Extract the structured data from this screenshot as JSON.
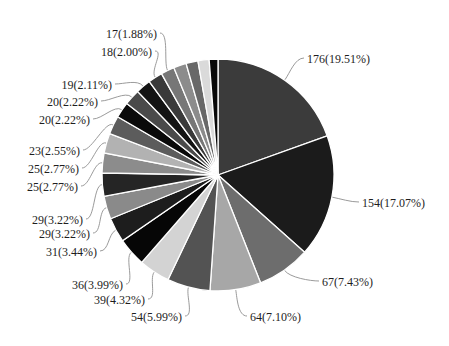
{
  "chart_data": {
    "type": "pie",
    "title": "",
    "start_angle": "12 o'clock",
    "direction": "clockwise",
    "total": 902,
    "layout": {
      "width": 449,
      "height": 346,
      "center": [
        218,
        175
      ],
      "radius": 116,
      "legend": "none",
      "labels": "outside with leader lines"
    },
    "slices": [
      {
        "value": 176,
        "percent": 19.51,
        "label": "176(19.51%)",
        "color": "#3b3b3b",
        "side": "right",
        "lx": 307,
        "ly": 59
      },
      {
        "value": 154,
        "percent": 17.07,
        "label": "154(17.07%)",
        "color": "#1b1b1b",
        "side": "right",
        "lx": 362,
        "ly": 203
      },
      {
        "value": 67,
        "percent": 7.43,
        "label": "67(7.43%)",
        "color": "#6d6d6d",
        "side": "right",
        "lx": 322,
        "ly": 282
      },
      {
        "value": 64,
        "percent": 7.1,
        "label": "64(7.10%)",
        "color": "#a7a7a7",
        "side": "right",
        "lx": 250,
        "ly": 317
      },
      {
        "value": 54,
        "percent": 5.99,
        "label": "54(5.99%)",
        "color": "#535353",
        "side": "left",
        "lx": 182,
        "ly": 317
      },
      {
        "value": 39,
        "percent": 4.32,
        "label": "39(4.32%)",
        "color": "#d3d3d3",
        "side": "left",
        "lx": 145,
        "ly": 300
      },
      {
        "value": 36,
        "percent": 3.99,
        "label": "36(3.99%)",
        "color": "#060606",
        "side": "left",
        "lx": 123,
        "ly": 285
      },
      {
        "value": 31,
        "percent": 3.44,
        "label": "31(3.44%)",
        "color": "#1d1d1d",
        "side": "left",
        "lx": 97,
        "ly": 252
      },
      {
        "value": 29,
        "percent": 3.22,
        "label": "29(3.22%)",
        "color": "#8a8a8a",
        "side": "left",
        "lx": 90,
        "ly": 234
      },
      {
        "value": 29,
        "percent": 3.22,
        "label": "29(3.22%)",
        "color": "#252525",
        "side": "left",
        "lx": 83,
        "ly": 220
      },
      {
        "value": 25,
        "percent": 2.77,
        "label": "25(2.77%)",
        "color": "#8c8c8c",
        "side": "left",
        "lx": 78,
        "ly": 187
      },
      {
        "value": 25,
        "percent": 2.77,
        "label": "25(2.77%)",
        "color": "#b2b2b2",
        "side": "left",
        "lx": 79,
        "ly": 169
      },
      {
        "value": 23,
        "percent": 2.55,
        "label": "23(2.55%)",
        "color": "#5c5c5c",
        "side": "left",
        "lx": 80,
        "ly": 151
      },
      {
        "value": 20,
        "percent": 2.22,
        "label": "20(2.22%)",
        "color": "#0a0a0a",
        "side": "left",
        "lx": 90,
        "ly": 120
      },
      {
        "value": 20,
        "percent": 2.22,
        "label": "20(2.22%)",
        "color": "#4a4a4a",
        "side": "left",
        "lx": 98,
        "ly": 102
      },
      {
        "value": 19,
        "percent": 2.11,
        "label": "19(2.11%)",
        "color": "#141414",
        "side": "left",
        "lx": 112,
        "ly": 85
      },
      {
        "value": 18,
        "percent": 2.0,
        "label": "18(2.00%)",
        "color": "#3a3a3a",
        "side": "left",
        "lx": 152,
        "ly": 52
      },
      {
        "value": 17,
        "percent": 1.88,
        "label": "17(1.88%)",
        "color": "#777777",
        "side": "left",
        "lx": 157,
        "ly": 34
      },
      {
        "value": 16,
        "percent": 1.77,
        "label": null,
        "color": "#8c8c8c"
      },
      {
        "value": 15,
        "percent": 1.66,
        "label": null,
        "color": "#686868"
      },
      {
        "value": 14,
        "percent": 1.55,
        "label": null,
        "color": "#dadada"
      },
      {
        "value": 11,
        "percent": 1.22,
        "label": null,
        "color": "#080808"
      }
    ]
  }
}
